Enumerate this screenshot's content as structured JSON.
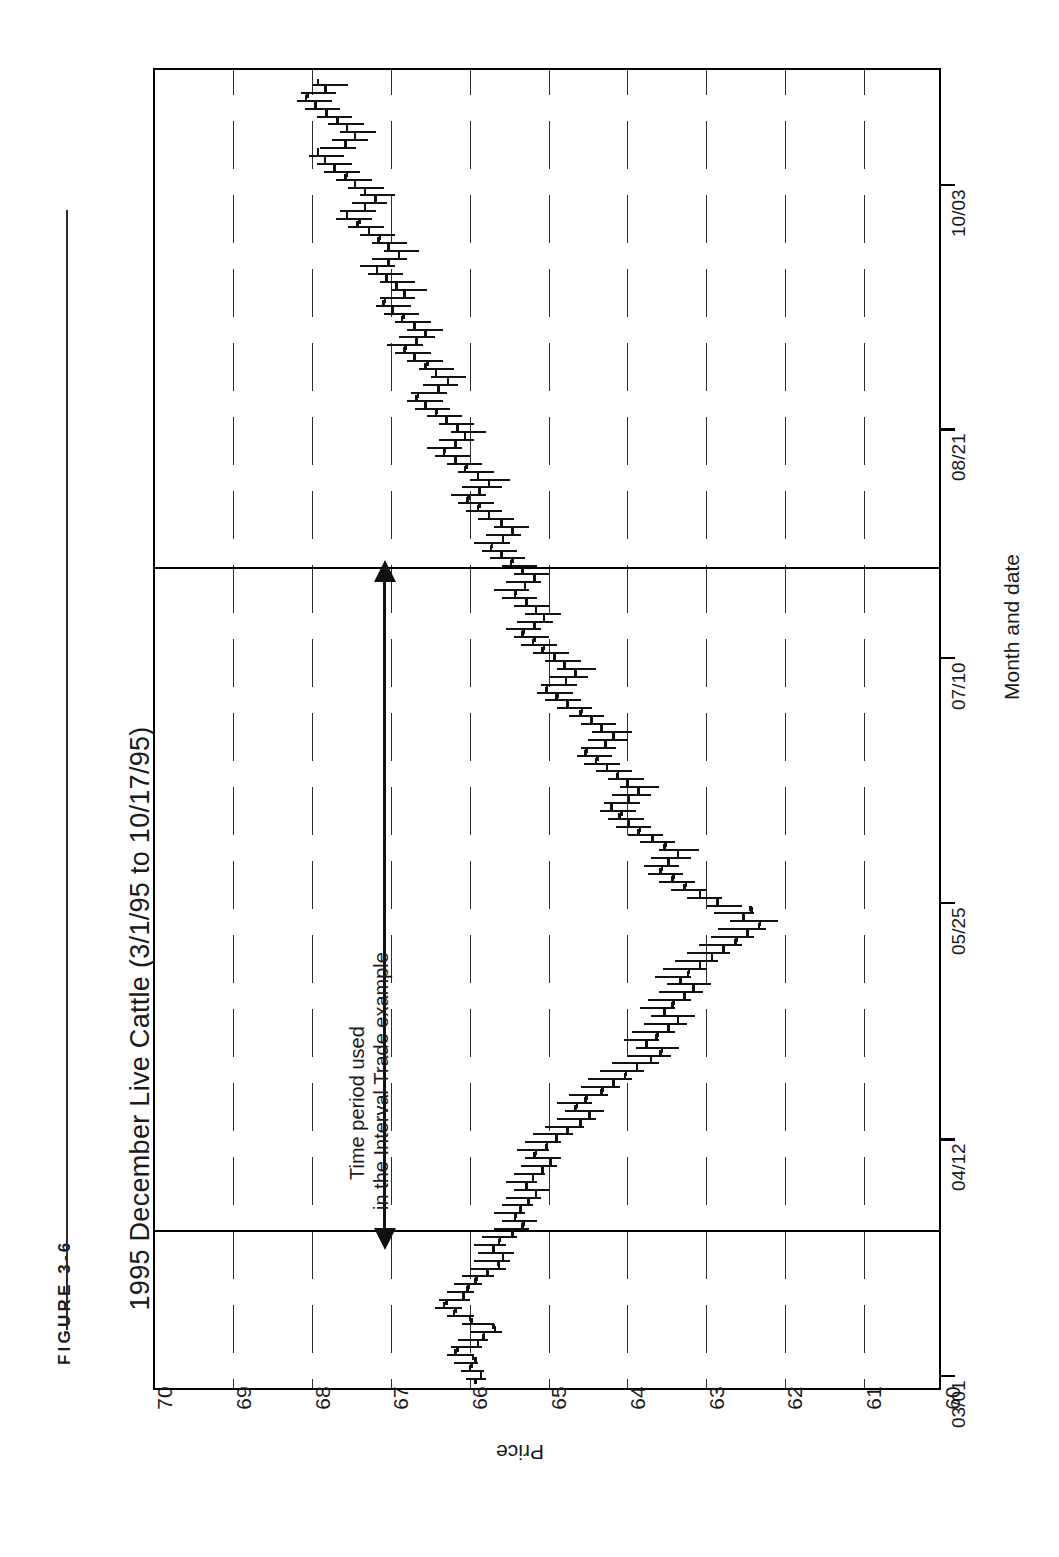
{
  "figure": {
    "label": "FIGURE  3-6",
    "title": "1995 December Live Cattle (3/1/95 to 10/17/95)"
  },
  "annotation": {
    "line1": "Time period used",
    "line2": "in the Interval Trade example",
    "arrow": "double-headed-vertical-arrow"
  },
  "axes": {
    "price_axis_title": "Price",
    "date_axis_title": "Month and date",
    "price_ticks": [
      "70",
      "69",
      "68",
      "67",
      "66",
      "65",
      "64",
      "63",
      "62",
      "61",
      "60"
    ],
    "date_ticks": [
      "03/01",
      "04/12",
      "05/25",
      "07/10",
      "08/21",
      "10/03"
    ]
  },
  "chart_data": {
    "type": "ohlc-bar",
    "orientation": "rotated-90-ccw",
    "title": "1995 December Live Cattle (3/1/95 to 10/17/95)",
    "xlabel": "Month and date",
    "ylabel": "Price",
    "ylim": [
      60,
      70
    ],
    "yticks": [
      70,
      69,
      68,
      67,
      66,
      65,
      64,
      63,
      62,
      61,
      60
    ],
    "grid": "dotted-price-gridlines",
    "legend": "none",
    "xtick_labels": [
      "03/01",
      "04/12",
      "05/25",
      "07/10",
      "08/21",
      "10/03"
    ],
    "xtick_indices": [
      0,
      30,
      60,
      91,
      120,
      151
    ],
    "n_bars": 165,
    "series_name": "December Live Cattle",
    "fields": [
      "high",
      "low",
      "open",
      "close"
    ],
    "bars": [
      [
        66.05,
        65.8,
        65.95,
        65.88
      ],
      [
        66.12,
        65.82,
        65.88,
        66.02
      ],
      [
        66.2,
        65.9,
        66.0,
        65.95
      ],
      [
        66.3,
        65.95,
        65.98,
        66.2
      ],
      [
        66.25,
        65.85,
        66.18,
        65.92
      ],
      [
        66.15,
        65.78,
        65.92,
        65.85
      ],
      [
        66.0,
        65.6,
        65.84,
        65.7
      ],
      [
        66.1,
        65.7,
        65.72,
        66.0
      ],
      [
        66.3,
        65.95,
        66.02,
        66.22
      ],
      [
        66.45,
        66.1,
        66.2,
        66.35
      ],
      [
        66.4,
        66.0,
        66.32,
        66.1
      ],
      [
        66.3,
        65.95,
        66.1,
        66.05
      ],
      [
        66.2,
        65.85,
        66.04,
        65.95
      ],
      [
        66.1,
        65.7,
        65.94,
        65.8
      ],
      [
        66.0,
        65.55,
        65.8,
        65.65
      ],
      [
        65.95,
        65.5,
        65.66,
        65.6
      ],
      [
        65.9,
        65.45,
        65.6,
        65.72
      ],
      [
        65.95,
        65.55,
        65.72,
        65.65
      ],
      [
        65.85,
        65.4,
        65.64,
        65.48
      ],
      [
        65.7,
        65.25,
        65.48,
        65.35
      ],
      [
        65.6,
        65.15,
        65.34,
        65.45
      ],
      [
        65.7,
        65.3,
        65.44,
        65.38
      ],
      [
        65.6,
        65.2,
        65.38,
        65.28
      ],
      [
        65.55,
        65.1,
        65.28,
        65.18
      ],
      [
        65.45,
        65.0,
        65.18,
        65.3
      ],
      [
        65.55,
        65.15,
        65.3,
        65.22
      ],
      [
        65.45,
        65.05,
        65.22,
        65.1
      ],
      [
        65.35,
        64.9,
        65.1,
        65.0
      ],
      [
        65.3,
        64.85,
        65.0,
        65.2
      ],
      [
        65.4,
        65.0,
        65.18,
        65.05
      ],
      [
        65.3,
        64.85,
        65.04,
        64.92
      ],
      [
        65.2,
        64.7,
        64.92,
        64.78
      ],
      [
        65.05,
        64.55,
        64.78,
        64.62
      ],
      [
        64.9,
        64.4,
        64.62,
        64.5
      ],
      [
        64.8,
        64.3,
        64.5,
        64.68
      ],
      [
        64.9,
        64.45,
        64.66,
        64.55
      ],
      [
        64.75,
        64.25,
        64.54,
        64.35
      ],
      [
        64.6,
        64.1,
        64.34,
        64.2
      ],
      [
        64.5,
        63.95,
        64.2,
        64.05
      ],
      [
        64.35,
        63.8,
        64.04,
        63.9
      ],
      [
        64.2,
        63.6,
        63.9,
        63.72
      ],
      [
        64.0,
        63.45,
        63.72,
        63.6
      ],
      [
        63.9,
        63.35,
        63.58,
        63.78
      ],
      [
        64.05,
        63.6,
        63.78,
        63.65
      ],
      [
        63.95,
        63.4,
        63.64,
        63.5
      ],
      [
        63.8,
        63.25,
        63.5,
        63.38
      ],
      [
        63.7,
        63.15,
        63.38,
        63.55
      ],
      [
        63.85,
        63.4,
        63.55,
        63.45
      ],
      [
        63.75,
        63.2,
        63.44,
        63.3
      ],
      [
        63.6,
        63.05,
        63.3,
        63.18
      ],
      [
        63.5,
        62.95,
        63.18,
        63.35
      ],
      [
        63.65,
        63.2,
        63.35,
        63.25
      ],
      [
        63.55,
        63.0,
        63.24,
        63.1
      ],
      [
        63.4,
        62.85,
        63.1,
        62.95
      ],
      [
        63.25,
        62.7,
        62.95,
        62.8
      ],
      [
        63.1,
        62.55,
        62.8,
        62.65
      ],
      [
        62.95,
        62.4,
        62.64,
        62.5
      ],
      [
        62.85,
        62.25,
        62.5,
        62.35
      ],
      [
        62.7,
        62.1,
        62.34,
        62.55
      ],
      [
        62.9,
        62.4,
        62.55,
        62.45
      ],
      [
        63.0,
        62.55,
        62.46,
        62.88
      ],
      [
        63.25,
        62.8,
        62.88,
        63.1
      ],
      [
        63.45,
        63.0,
        63.1,
        63.3
      ],
      [
        63.6,
        63.15,
        63.28,
        63.45
      ],
      [
        63.75,
        63.3,
        63.44,
        63.6
      ],
      [
        63.8,
        63.35,
        63.58,
        63.5
      ],
      [
        63.7,
        63.2,
        63.5,
        63.38
      ],
      [
        63.6,
        63.1,
        63.38,
        63.55
      ],
      [
        63.85,
        63.4,
        63.54,
        63.7
      ],
      [
        64.0,
        63.55,
        63.7,
        63.88
      ],
      [
        64.15,
        63.7,
        63.86,
        64.0
      ],
      [
        64.25,
        63.8,
        64.0,
        64.12
      ],
      [
        64.35,
        63.9,
        64.1,
        64.22
      ],
      [
        64.3,
        63.85,
        64.22,
        64.0
      ],
      [
        64.2,
        63.7,
        64.0,
        63.88
      ],
      [
        64.1,
        63.6,
        63.88,
        64.02
      ],
      [
        64.25,
        63.8,
        64.02,
        64.15
      ],
      [
        64.4,
        63.95,
        64.14,
        64.28
      ],
      [
        64.55,
        64.1,
        64.28,
        64.42
      ],
      [
        64.65,
        64.2,
        64.4,
        64.55
      ],
      [
        64.6,
        64.15,
        64.54,
        64.3
      ],
      [
        64.5,
        64.0,
        64.3,
        64.2
      ],
      [
        64.45,
        63.95,
        64.2,
        64.35
      ],
      [
        64.6,
        64.15,
        64.35,
        64.48
      ],
      [
        64.75,
        64.3,
        64.48,
        64.62
      ],
      [
        64.9,
        64.45,
        64.6,
        64.78
      ],
      [
        65.05,
        64.6,
        64.78,
        64.92
      ],
      [
        65.15,
        64.7,
        64.9,
        65.05
      ],
      [
        65.1,
        64.65,
        65.04,
        64.8
      ],
      [
        65.0,
        64.5,
        64.8,
        64.68
      ],
      [
        64.9,
        64.4,
        64.68,
        64.82
      ],
      [
        65.05,
        64.6,
        64.82,
        64.95
      ],
      [
        65.2,
        64.75,
        64.95,
        65.1
      ],
      [
        65.35,
        64.9,
        65.08,
        65.22
      ],
      [
        65.45,
        65.0,
        65.2,
        65.35
      ],
      [
        65.55,
        65.1,
        65.34,
        65.2
      ],
      [
        65.4,
        64.95,
        65.2,
        65.08
      ],
      [
        65.3,
        64.85,
        65.08,
        65.18
      ],
      [
        65.45,
        65.0,
        65.18,
        65.3
      ],
      [
        65.6,
        65.15,
        65.3,
        65.45
      ],
      [
        65.7,
        65.25,
        65.44,
        65.32
      ],
      [
        65.55,
        65.1,
        65.32,
        65.2
      ],
      [
        65.45,
        65.0,
        65.2,
        65.35
      ],
      [
        65.6,
        65.15,
        65.35,
        65.5
      ],
      [
        65.75,
        65.3,
        65.48,
        65.62
      ],
      [
        65.85,
        65.4,
        65.62,
        65.75
      ],
      [
        65.95,
        65.5,
        65.74,
        65.6
      ],
      [
        65.8,
        65.35,
        65.6,
        65.48
      ],
      [
        65.7,
        65.25,
        65.48,
        65.62
      ],
      [
        65.9,
        65.45,
        65.62,
        65.78
      ],
      [
        66.05,
        65.6,
        65.78,
        65.92
      ],
      [
        66.15,
        65.7,
        65.9,
        66.05
      ],
      [
        66.25,
        65.8,
        66.04,
        65.9
      ],
      [
        66.1,
        65.6,
        65.9,
        65.78
      ],
      [
        66.0,
        65.5,
        65.78,
        65.92
      ],
      [
        66.15,
        65.7,
        65.92,
        66.08
      ],
      [
        66.3,
        65.85,
        66.06,
        66.2
      ],
      [
        66.45,
        66.0,
        66.2,
        66.35
      ],
      [
        66.55,
        66.1,
        66.34,
        66.2
      ],
      [
        66.4,
        65.95,
        66.2,
        66.08
      ],
      [
        66.25,
        65.8,
        66.08,
        66.18
      ],
      [
        66.4,
        65.95,
        66.18,
        66.32
      ],
      [
        66.55,
        66.1,
        66.32,
        66.45
      ],
      [
        66.7,
        66.25,
        66.44,
        66.58
      ],
      [
        66.8,
        66.35,
        66.58,
        66.7
      ],
      [
        66.75,
        66.3,
        66.68,
        66.42
      ],
      [
        66.6,
        66.15,
        66.42,
        66.3
      ],
      [
        66.5,
        66.05,
        66.3,
        66.45
      ],
      [
        66.65,
        66.2,
        66.45,
        66.58
      ],
      [
        66.8,
        66.35,
        66.56,
        66.72
      ],
      [
        66.95,
        66.5,
        66.72,
        66.85
      ],
      [
        67.05,
        66.6,
        66.84,
        66.7
      ],
      [
        66.9,
        66.45,
        66.7,
        66.58
      ],
      [
        66.8,
        66.35,
        66.58,
        66.72
      ],
      [
        66.95,
        66.5,
        66.72,
        66.88
      ],
      [
        67.1,
        66.65,
        66.86,
        67.0
      ],
      [
        67.2,
        66.75,
        67.0,
        67.12
      ],
      [
        67.15,
        66.7,
        67.1,
        66.85
      ],
      [
        67.0,
        66.55,
        66.85,
        66.95
      ],
      [
        67.15,
        66.7,
        66.95,
        67.08
      ],
      [
        67.3,
        66.85,
        67.08,
        67.2
      ],
      [
        67.4,
        66.95,
        67.2,
        67.05
      ],
      [
        67.25,
        66.8,
        67.05,
        66.92
      ],
      [
        67.1,
        66.65,
        66.92,
        67.05
      ],
      [
        67.25,
        66.8,
        67.05,
        67.18
      ],
      [
        67.4,
        66.95,
        67.16,
        67.3
      ],
      [
        67.55,
        67.1,
        67.3,
        67.45
      ],
      [
        67.7,
        67.25,
        67.42,
        67.58
      ],
      [
        67.65,
        67.2,
        67.58,
        67.35
      ],
      [
        67.5,
        67.05,
        67.35,
        67.22
      ],
      [
        67.4,
        66.95,
        67.22,
        67.35
      ],
      [
        67.55,
        67.1,
        67.35,
        67.48
      ],
      [
        67.7,
        67.25,
        67.48,
        67.6
      ],
      [
        67.85,
        67.4,
        67.58,
        67.74
      ],
      [
        67.95,
        67.5,
        67.74,
        67.86
      ],
      [
        68.05,
        67.6,
        67.86,
        67.95
      ],
      [
        67.9,
        67.45,
        67.95,
        67.6
      ],
      [
        67.75,
        67.3,
        67.6,
        67.48
      ],
      [
        67.65,
        67.2,
        67.48,
        67.58
      ],
      [
        67.8,
        67.35,
        67.58,
        67.7
      ],
      [
        67.95,
        67.5,
        67.7,
        67.84
      ],
      [
        68.1,
        67.65,
        67.84,
        67.98
      ],
      [
        68.2,
        67.75,
        67.98,
        68.1
      ],
      [
        68.15,
        67.7,
        68.08,
        67.85
      ],
      [
        68.0,
        67.55,
        67.85,
        67.95
      ]
    ]
  }
}
